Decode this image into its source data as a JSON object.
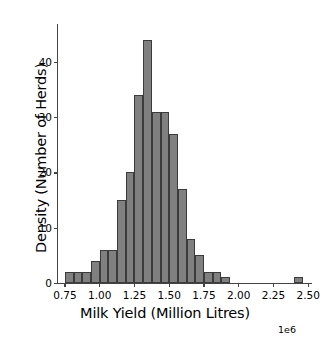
{
  "chart_data": {
    "type": "bar",
    "title": "",
    "xlabel": "Milk Yield (Million Litres)",
    "ylabel": "Density (Number of Herds)",
    "x_exponent_label": "1e6",
    "xlim": [
      0.7,
      2.52
    ],
    "ylim": [
      0,
      46.5
    ],
    "grid": false,
    "legend": null,
    "bin_width": 0.0625,
    "x_unit": "1e6 litres",
    "xticks": [
      0.75,
      1.0,
      1.25,
      1.5,
      1.75,
      2.0,
      2.25,
      2.5
    ],
    "xtick_labels": [
      "0.75",
      "1.00",
      "1.25",
      "1.50",
      "1.75",
      "2.00",
      "2.25",
      "2.50"
    ],
    "yticks": [
      0,
      10,
      20,
      30,
      40
    ],
    "ytick_labels": [
      "0",
      "10",
      "20",
      "30",
      "40"
    ],
    "bar_color": "#808080",
    "bar_edge_color": "#3b3b3b",
    "bins": [
      {
        "left": 0.75,
        "right": 0.8125,
        "value": 2
      },
      {
        "left": 0.8125,
        "right": 0.875,
        "value": 2
      },
      {
        "left": 0.875,
        "right": 0.9375,
        "value": 2
      },
      {
        "left": 0.9375,
        "right": 1.0,
        "value": 4
      },
      {
        "left": 1.0,
        "right": 1.0625,
        "value": 6
      },
      {
        "left": 1.0625,
        "right": 1.125,
        "value": 6
      },
      {
        "left": 1.125,
        "right": 1.1875,
        "value": 15
      },
      {
        "left": 1.1875,
        "right": 1.25,
        "value": 20
      },
      {
        "left": 1.25,
        "right": 1.3125,
        "value": 34
      },
      {
        "left": 1.3125,
        "right": 1.375,
        "value": 44
      },
      {
        "left": 1.375,
        "right": 1.4375,
        "value": 31
      },
      {
        "left": 1.4375,
        "right": 1.5,
        "value": 31
      },
      {
        "left": 1.5,
        "right": 1.5625,
        "value": 27
      },
      {
        "left": 1.5625,
        "right": 1.625,
        "value": 17
      },
      {
        "left": 1.625,
        "right": 1.6875,
        "value": 8
      },
      {
        "left": 1.6875,
        "right": 1.75,
        "value": 5
      },
      {
        "left": 1.75,
        "right": 1.8125,
        "value": 2
      },
      {
        "left": 1.8125,
        "right": 1.875,
        "value": 2
      },
      {
        "left": 1.875,
        "right": 1.9375,
        "value": 1
      },
      {
        "left": 2.4,
        "right": 2.46,
        "value": 1
      }
    ]
  }
}
